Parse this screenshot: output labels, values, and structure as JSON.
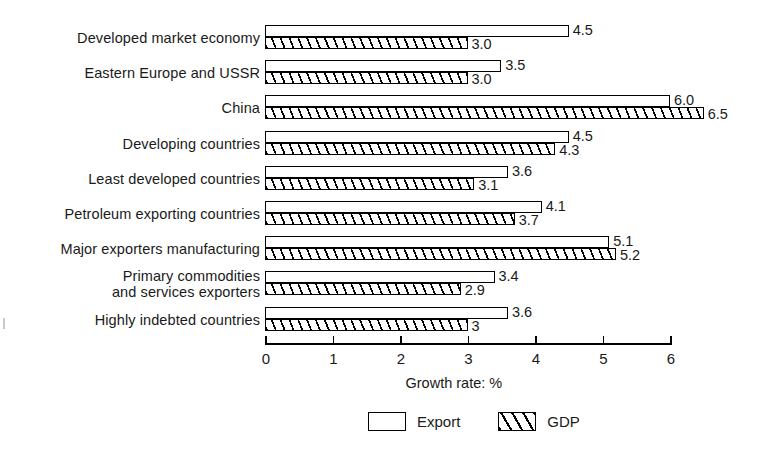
{
  "chart_data": {
    "type": "bar",
    "orientation": "horizontal",
    "title": "",
    "xlabel": "Growth rate: %",
    "ylabel": "",
    "xlim": [
      0,
      6
    ],
    "xticks": [
      "0",
      "1",
      "2",
      "3",
      "4",
      "5",
      "6"
    ],
    "grid": false,
    "legend_position": "bottom-center",
    "categories": [
      "Developed market economy",
      "Eastern Europe and USSR",
      "China",
      "Developing countries",
      "Least developed countries",
      "Petroleum exporting countries",
      "Major exporters manufacturing",
      "Primary commodities\nand services exporters",
      "Highly indebted countries"
    ],
    "series": [
      {
        "name": "Export",
        "fill": "white",
        "values": [
          4.5,
          3.5,
          6.0,
          4.5,
          3.6,
          4.1,
          5.1,
          3.4,
          3.6
        ],
        "labels": [
          "4.5",
          "3.5",
          "6.0",
          "4.5",
          "3.6",
          "4.1",
          "5.1",
          "3.4",
          "3.6"
        ]
      },
      {
        "name": "GDP",
        "fill": "diagonal-hatch",
        "values": [
          3.0,
          3.0,
          6.5,
          4.3,
          3.1,
          3.7,
          5.2,
          2.9,
          3.0
        ],
        "labels": [
          "3.0",
          "3.0",
          "6.5",
          "4.3",
          "3.1",
          "3.7",
          "5.2",
          "2.9",
          "3"
        ]
      }
    ]
  },
  "legend": {
    "items": [
      {
        "label": "Export",
        "swatch": "empty-rectangle-swatch"
      },
      {
        "label": "GDP",
        "swatch": "hatched-rectangle-swatch"
      }
    ]
  },
  "axis": {
    "title": "Growth rate: %",
    "ticks": [
      "0",
      "1",
      "2",
      "3",
      "4",
      "5",
      "6"
    ]
  }
}
